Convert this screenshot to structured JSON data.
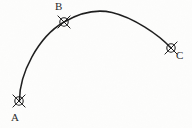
{
  "figure": {
    "title": "",
    "background_color": "#fdfdfc",
    "ink_color": "#1f1f1f",
    "width": 192,
    "height": 128
  },
  "points": [
    {
      "id": "A",
      "label": "A",
      "marker": "circle-x-marker",
      "x": 19,
      "y": 101,
      "radius": 4.2,
      "label_x": 11,
      "label_y": 112,
      "label_position": "below-left"
    },
    {
      "id": "B",
      "label": "B",
      "marker": "circle-x-marker",
      "x": 64,
      "y": 22,
      "radius": 4.2,
      "label_x": 55,
      "label_y": 1,
      "label_position": "above-left"
    },
    {
      "id": "C",
      "label": "C",
      "marker": "circle-x-marker",
      "x": 171,
      "y": 48,
      "radius": 4.2,
      "label_x": 176,
      "label_y": 50,
      "label_position": "right"
    }
  ],
  "curve": {
    "name": "trajectory-arc",
    "stroke_width": 1.5,
    "stroke_color": "#1f1f1f",
    "path": "M 19.5 101.5 C 19.0 74.0 38.0 37.0 64.0 22.0 C 82.0 11.5 99.0 9.5 112.0 12.5 C 133.0 17.5 158.0 34.0 171.0 48.0",
    "description": "smooth arc rising from A through B to apex then descending to C",
    "apex": {
      "x": 104,
      "y": 11
    }
  },
  "chart_data": {
    "type": "line",
    "title": "",
    "xlabel": "",
    "ylabel": "",
    "grid": false,
    "legend": null,
    "annotations": [
      "A",
      "B",
      "C"
    ],
    "series": [
      {
        "name": "trajectory-arc",
        "x": [
          19.5,
          26,
          34,
          44,
          55,
          64,
          75,
          88,
          100,
          112,
          124,
          137,
          150,
          162,
          171
        ],
        "y": [
          101.5,
          84,
          66,
          48,
          32,
          22,
          15,
          11,
          10.5,
          12.5,
          17,
          24,
          32,
          41,
          48
        ]
      }
    ],
    "marked_points": [
      {
        "label": "A",
        "x": 19,
        "y": 101
      },
      {
        "label": "B",
        "x": 64,
        "y": 22
      },
      {
        "label": "C",
        "x": 171,
        "y": 48
      }
    ],
    "xlim": [
      0,
      192
    ],
    "ylim": [
      128,
      0
    ]
  }
}
